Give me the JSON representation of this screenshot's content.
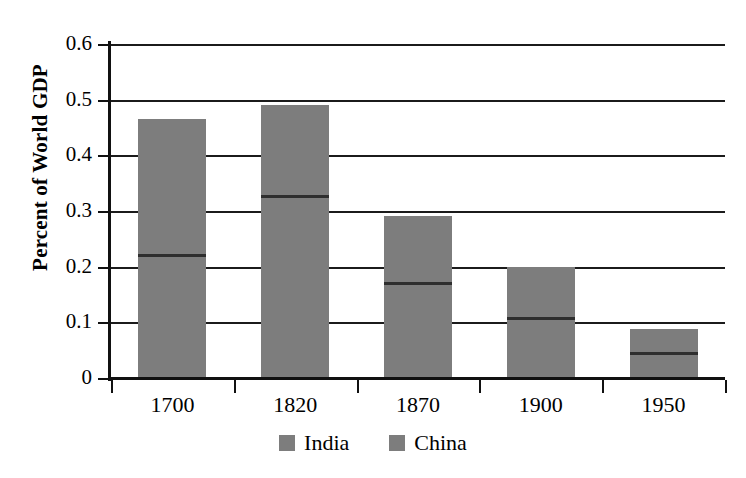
{
  "chart_data": {
    "type": "bar",
    "subtype": "stacked-bar",
    "title": "",
    "xlabel": "",
    "ylabel": "Percent of World GDP",
    "categories": [
      "1700",
      "1820",
      "1870",
      "1900",
      "1950"
    ],
    "ylim": [
      0,
      0.6
    ],
    "ytick_labels": [
      "0.6",
      "0.5",
      "0.4",
      "0.3",
      "0.2",
      "0.1",
      "0"
    ],
    "ytick_values": [
      0.6,
      0.5,
      0.4,
      0.3,
      0.2,
      0.1,
      0
    ],
    "grid": true,
    "legend_position": "bottom",
    "series": [
      {
        "name": "India",
        "color": "#7d7d7d",
        "values": [
          0.243,
          0.162,
          0.118,
          0.09,
          0.042
        ]
      },
      {
        "name": "China",
        "color": "#7d7d7d",
        "values": [
          0.223,
          0.328,
          0.173,
          0.11,
          0.046
        ]
      }
    ],
    "totals": [
      0.466,
      0.49,
      0.291,
      0.2,
      0.088
    ],
    "dividers": [
      0.223,
      0.328,
      0.173,
      0.11,
      0.046
    ]
  },
  "legend": {
    "items": [
      {
        "label": "India",
        "color": "#7d7d7d"
      },
      {
        "label": "China",
        "color": "#7d7d7d"
      }
    ]
  },
  "axis": {
    "y_title": "Percent of World GDP"
  }
}
